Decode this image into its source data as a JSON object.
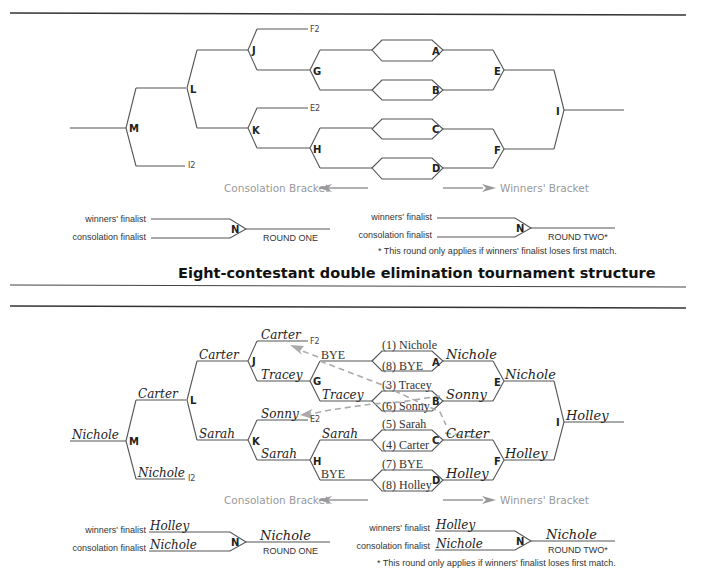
{
  "title": "Eight-contestant double elimination tournament structure",
  "legend": {
    "consolation": "Consolation Bracket",
    "winners": "Winners' Bracket"
  },
  "match_labels": {
    "A": "A",
    "B": "B",
    "C": "C",
    "D": "D",
    "E": "E",
    "F": "F",
    "G": "G",
    "H": "H",
    "I": "I",
    "J": "J",
    "K": "K",
    "L": "L",
    "M": "M",
    "N": "N"
  },
  "feed_labels": {
    "F2": "F2",
    "E2": "E2",
    "I2": "I2"
  },
  "final": {
    "winners_finalist": "winners' finalist",
    "consolation_finalist": "consolation finalist",
    "round_one": "ROUND ONE",
    "round_two": "ROUND TWO*",
    "footnote": "* This round only applies if winners' finalist loses first match."
  },
  "example": {
    "seeds": {
      "A_top": "(1) Nichole",
      "A_bottom": "(8) BYE",
      "B_top": "(3) Tracey",
      "B_bottom": "(6) Sonny",
      "C_top": "(5) Sarah",
      "C_bottom": "(4) Carter",
      "D_top": "(7) BYE",
      "D_bottom": "(8) Holley"
    },
    "winners": {
      "A": "Nichole",
      "B": "Sonny",
      "C": "Carter",
      "D": "Holley",
      "E": "Nichole",
      "F": "Holley",
      "I": "Holley"
    },
    "consolation": {
      "G_top": "BYE",
      "G_bottom": "Tracey",
      "H_top": "Sarah",
      "H_bottom": "BYE",
      "F2": "Carter",
      "E2": "Sonny",
      "J_bottom": "Tracey",
      "K_bottom": "Sarah",
      "J": "Carter",
      "K": "Sarah",
      "L": "Carter",
      "I2": "Nichole",
      "M": "Nichole"
    },
    "final_round_one": {
      "winners_finalist": "Holley",
      "consolation_finalist": "Nichole",
      "result": "Nichole"
    },
    "final_round_two": {
      "winners_finalist": "Holley",
      "consolation_finalist": "Nichole",
      "result": "Nichole"
    }
  }
}
